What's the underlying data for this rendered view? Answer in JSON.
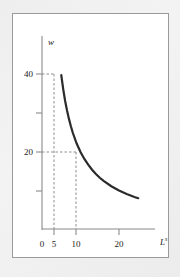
{
  "figure": {
    "name": "labor-supply-curve-figure",
    "background_color": "#ffffff",
    "frame_border_color": "#9a9a9a",
    "page_background_color": "#eeeeee"
  },
  "chart_data": {
    "type": "line",
    "title": "",
    "subtitle": "",
    "xlabel": "L",
    "xlabel_superscript": "s",
    "ylabel": "w",
    "xlim": [
      0,
      27
    ],
    "ylim": [
      0,
      52
    ],
    "grid": false,
    "legend": null,
    "curve_color": "#2b2b2b",
    "axis_color": "#8a8a8a",
    "guide_color": "#9a9a9a",
    "x_ticks": [
      {
        "value": 0,
        "label": "0"
      },
      {
        "value": 5,
        "label": "5"
      },
      {
        "value": 10,
        "label": "10"
      },
      {
        "value": 20,
        "label": "20"
      }
    ],
    "y_ticks": [
      {
        "value": 40,
        "label": "40"
      },
      {
        "value": 30,
        "label": ""
      },
      {
        "value": 20,
        "label": "20"
      },
      {
        "value": 10,
        "label": ""
      }
    ],
    "series": [
      {
        "name": "labor-supply",
        "relation": "w = 200 / L",
        "x": [
          5.0,
          5.5,
          6.0,
          6.5,
          7.0,
          7.5,
          8.0,
          9.0,
          10.0,
          11.0,
          12.0,
          13.0,
          14.0,
          15.0,
          16.0,
          18.0,
          20.0,
          22.0,
          24.0,
          25.0
        ],
        "y": [
          40.0,
          36.4,
          33.3,
          30.8,
          28.6,
          26.7,
          25.0,
          22.2,
          20.0,
          18.2,
          16.7,
          15.4,
          14.3,
          13.3,
          12.5,
          11.1,
          10.0,
          9.1,
          8.3,
          8.0
        ]
      }
    ],
    "annotations": [
      {
        "name": "guide-w-40",
        "type": "dashed-horizontal",
        "y": 40,
        "x_from": 0,
        "x_to": 5
      },
      {
        "name": "guide-l-5",
        "type": "dashed-vertical",
        "x": 5,
        "y_from": 0,
        "y_to": 40
      },
      {
        "name": "guide-w-20",
        "type": "dashed-horizontal",
        "y": 20,
        "x_from": 0,
        "x_to": 10
      },
      {
        "name": "guide-l-10",
        "type": "dashed-vertical",
        "x": 10,
        "y_from": 0,
        "y_to": 20
      }
    ]
  }
}
